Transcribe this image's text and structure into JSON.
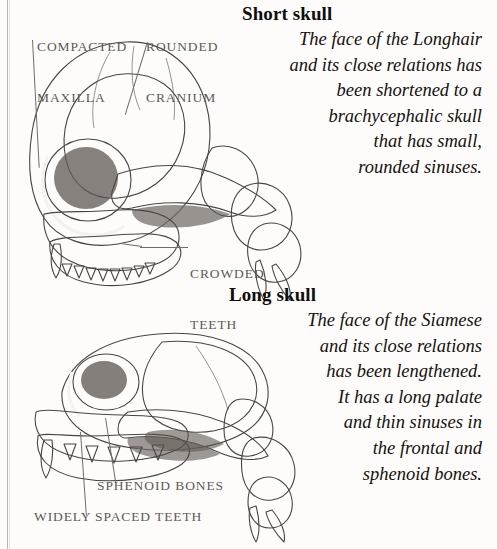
{
  "page": {
    "width": 497,
    "height": 549,
    "background": "#fdfcfb",
    "rule_color": "#b9b6b2"
  },
  "labels": {
    "compacted_maxilla_line1": "COMPACTED",
    "compacted_maxilla_line2": "MAXILLA",
    "rounded_cranium_line1": "ROUNDED",
    "rounded_cranium_line2": "CRANIUM",
    "crowded_teeth_line1": "CROWDED",
    "crowded_teeth_line2": "TEETH",
    "sphenoid_bones": "SPHENOID BONES",
    "widely_spaced_teeth": "WIDELY SPACED TEETH",
    "color": "#5d5a57"
  },
  "sections": [
    {
      "id": "short-skull",
      "heading": "Short skull",
      "body_lines": [
        "The face of the Longhair",
        "and its close relations has",
        "been shortened to a",
        "brachycephalic skull",
        "that has small,",
        "rounded sinuses."
      ],
      "body_text": "The face of the Longhair and its close relations has been shortened to a brachycephalic skull that has small, rounded sinuses."
    },
    {
      "id": "long-skull",
      "heading": "Long skull",
      "body_lines": [
        "The face of the Siamese",
        "and its close relations",
        "has been lengthened.",
        "It has a long palate",
        "and thin sinuses in",
        "the frontal and",
        "sphenoid bones."
      ],
      "body_text": "The face of the Siamese and its close relations has been lengthened. It has a long palate and thin sinuses in the frontal and sphenoid bones."
    }
  ],
  "illustrations": [
    {
      "id": "brachycephalic-skull",
      "name": "Short (brachycephalic) cat skull, lateral view",
      "medium": "pencil and wash drawing"
    },
    {
      "id": "dolichocephalic-skull",
      "name": "Long (dolichocephalic) cat skull, lateral view",
      "medium": "pencil and wash drawing"
    }
  ]
}
